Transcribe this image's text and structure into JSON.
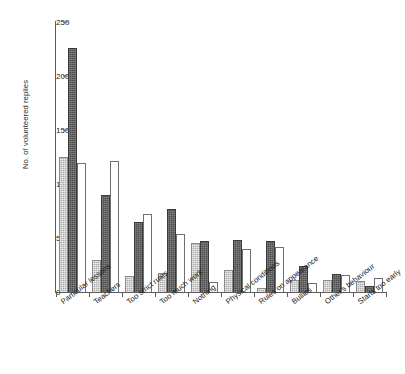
{
  "chart_data": {
    "type": "bar",
    "title": "",
    "xlabel": "",
    "ylabel": "No. of volunteered replies",
    "ylim": [
      0,
      250
    ],
    "yticks": [
      0,
      50,
      100,
      150,
      200,
      250
    ],
    "grid": false,
    "legend": "none",
    "categories": [
      "Particular lessons",
      "Teachers",
      "Too strict rules",
      "Too much work",
      "Nothing",
      "Physical conditions",
      "Rules on appearance",
      "Bullies",
      "Other's behaviour",
      "Starts too early"
    ],
    "series": [
      {
        "name": "series-1-light-grey",
        "color": "#a9a9a9",
        "values": [
          125,
          30,
          15,
          18,
          45,
          20,
          4,
          11,
          11,
          10
        ]
      },
      {
        "name": "series-2-dark-grey",
        "color": "#4f4f4f",
        "values": [
          226,
          90,
          65,
          77,
          47,
          48,
          47,
          24,
          17,
          6
        ]
      },
      {
        "name": "series-3-white",
        "color": "#ffffff",
        "values": [
          119,
          121,
          72,
          54,
          9,
          40,
          42,
          8,
          16,
          13
        ]
      }
    ]
  },
  "caption": ""
}
